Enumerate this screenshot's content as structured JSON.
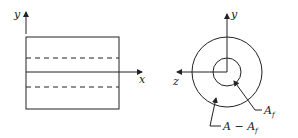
{
  "left_view": {
    "y_axis_label": "y",
    "x_axis_label": "x"
  },
  "right_view": {
    "y_axis_label": "y",
    "z_axis_label": "z",
    "inner_area_label": "A",
    "inner_area_sub": "f",
    "outer_area_label": "A − A",
    "outer_area_sub": "f"
  },
  "colors": {
    "line": "#222222",
    "background": "#ffffff"
  }
}
